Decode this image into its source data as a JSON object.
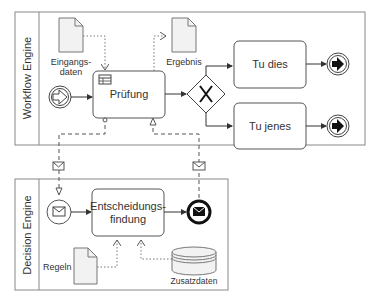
{
  "pools": {
    "workflow": {
      "label": "Workflow Engine"
    },
    "decision": {
      "label": "Decision Engine"
    }
  },
  "workflow": {
    "data_input": {
      "label_line1": "Eingangs-",
      "label_line2": "daten"
    },
    "data_output": {
      "label": "Ergebnis"
    },
    "task_pruefung": {
      "label": "Prüfung"
    },
    "task_tu_dies": {
      "label": "Tu dies"
    },
    "task_tu_jenes": {
      "label": "Tu jenes"
    }
  },
  "decision": {
    "task_entscheidung": {
      "label_line1": "Entscheidungs-",
      "label_line2": "findung"
    },
    "data_regeln": {
      "label": "Regeln"
    },
    "datastore": {
      "label": "Zusatzdaten"
    }
  },
  "colors": {
    "stroke": "#555555",
    "dark": "#111111",
    "task_fill": "#ffffff",
    "doc_fill": "#f2f2f2"
  }
}
